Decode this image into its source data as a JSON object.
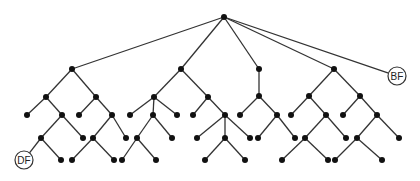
{
  "diagram": {
    "type": "tree",
    "colors": {
      "edge": "#333333",
      "node": "#111111",
      "label_circle_fill": "#ffffff"
    },
    "node_radius": 3,
    "labeled_nodes": [
      {
        "id": "BF",
        "label": "BF",
        "x": 397,
        "y": 76,
        "r": 9
      },
      {
        "id": "DF",
        "label": "DF",
        "x": 24,
        "y": 160,
        "r": 9
      }
    ],
    "nodes": [
      {
        "id": "root",
        "x": 224,
        "y": 17
      },
      {
        "id": "A",
        "x": 72,
        "y": 69
      },
      {
        "id": "B",
        "x": 181,
        "y": 69
      },
      {
        "id": "C",
        "x": 259,
        "y": 69
      },
      {
        "id": "D",
        "x": 334,
        "y": 69
      },
      {
        "id": "A1",
        "x": 46,
        "y": 97
      },
      {
        "id": "A1L",
        "x": 27,
        "y": 115
      },
      {
        "id": "A1a",
        "x": 62,
        "y": 115
      },
      {
        "id": "A1a1",
        "x": 41,
        "y": 138
      },
      {
        "id": "A1aL",
        "x": 83,
        "y": 138
      },
      {
        "id": "A1a1R",
        "x": 61,
        "y": 160
      },
      {
        "id": "A2",
        "x": 96,
        "y": 97
      },
      {
        "id": "A2L",
        "x": 79,
        "y": 115
      },
      {
        "id": "A2a",
        "x": 112,
        "y": 115
      },
      {
        "id": "A2a1",
        "x": 93,
        "y": 138
      },
      {
        "id": "A2aL",
        "x": 126,
        "y": 138
      },
      {
        "id": "A2a1L",
        "x": 72,
        "y": 160
      },
      {
        "id": "A2a1R",
        "x": 114,
        "y": 160
      },
      {
        "id": "B1",
        "x": 154,
        "y": 97
      },
      {
        "id": "B1L",
        "x": 130,
        "y": 115
      },
      {
        "id": "B1a",
        "x": 153,
        "y": 115
      },
      {
        "id": "B1R",
        "x": 177,
        "y": 115
      },
      {
        "id": "B1a1",
        "x": 137,
        "y": 138
      },
      {
        "id": "B1aR",
        "x": 172,
        "y": 138
      },
      {
        "id": "B1a1L",
        "x": 122,
        "y": 160
      },
      {
        "id": "B1a1R",
        "x": 156,
        "y": 160
      },
      {
        "id": "B2",
        "x": 208,
        "y": 97
      },
      {
        "id": "B2L",
        "x": 193,
        "y": 115
      },
      {
        "id": "B2a",
        "x": 225,
        "y": 115
      },
      {
        "id": "B2aL",
        "x": 197,
        "y": 138
      },
      {
        "id": "B2a1",
        "x": 225,
        "y": 138
      },
      {
        "id": "B2aR",
        "x": 250,
        "y": 138
      },
      {
        "id": "B2a1L",
        "x": 205,
        "y": 160
      },
      {
        "id": "B2a1R",
        "x": 245,
        "y": 160
      },
      {
        "id": "C1",
        "x": 259,
        "y": 96
      },
      {
        "id": "C1L",
        "x": 240,
        "y": 115
      },
      {
        "id": "C1a",
        "x": 277,
        "y": 115
      },
      {
        "id": "C1aL",
        "x": 258,
        "y": 138
      },
      {
        "id": "C1aR",
        "x": 295,
        "y": 138
      },
      {
        "id": "D1",
        "x": 309,
        "y": 96
      },
      {
        "id": "D1L",
        "x": 291,
        "y": 115
      },
      {
        "id": "D1a",
        "x": 326,
        "y": 115
      },
      {
        "id": "D1a1",
        "x": 305,
        "y": 138
      },
      {
        "id": "D1aR",
        "x": 346,
        "y": 138
      },
      {
        "id": "D1a1L",
        "x": 282,
        "y": 160
      },
      {
        "id": "D1a1R",
        "x": 328,
        "y": 160
      },
      {
        "id": "D2",
        "x": 360,
        "y": 96
      },
      {
        "id": "D2L",
        "x": 343,
        "y": 115
      },
      {
        "id": "D2a",
        "x": 377,
        "y": 115
      },
      {
        "id": "D2a1",
        "x": 357,
        "y": 138
      },
      {
        "id": "D2aR",
        "x": 399,
        "y": 138
      },
      {
        "id": "D2a1L",
        "x": 335,
        "y": 160
      },
      {
        "id": "D2a1R",
        "x": 382,
        "y": 160
      }
    ],
    "edges": [
      [
        "root",
        "A"
      ],
      [
        "root",
        "B"
      ],
      [
        "root",
        "C"
      ],
      [
        "root",
        "D"
      ],
      [
        "root",
        "BF"
      ],
      [
        "A",
        "A1"
      ],
      [
        "A",
        "A2"
      ],
      [
        "A1",
        "A1L"
      ],
      [
        "A1",
        "A1a"
      ],
      [
        "A1a",
        "A1a1"
      ],
      [
        "A1a",
        "A1aL"
      ],
      [
        "A1a1",
        "DF"
      ],
      [
        "A1a1",
        "A1a1R"
      ],
      [
        "A2",
        "A2L"
      ],
      [
        "A2",
        "A2a"
      ],
      [
        "A2a",
        "A2a1"
      ],
      [
        "A2a",
        "A2aL"
      ],
      [
        "A2a1",
        "A2a1L"
      ],
      [
        "A2a1",
        "A2a1R"
      ],
      [
        "B",
        "B1"
      ],
      [
        "B",
        "B2"
      ],
      [
        "B1",
        "B1L"
      ],
      [
        "B1",
        "B1a"
      ],
      [
        "B1",
        "B1R"
      ],
      [
        "B1a",
        "B1a1"
      ],
      [
        "B1a",
        "B1aR"
      ],
      [
        "B1a1",
        "B1a1L"
      ],
      [
        "B1a1",
        "B1a1R"
      ],
      [
        "B2",
        "B2L"
      ],
      [
        "B2",
        "B2a"
      ],
      [
        "B2a",
        "B2aL"
      ],
      [
        "B2a",
        "B2a1"
      ],
      [
        "B2a",
        "B2aR"
      ],
      [
        "B2a1",
        "B2a1L"
      ],
      [
        "B2a1",
        "B2a1R"
      ],
      [
        "C",
        "C1"
      ],
      [
        "C1",
        "C1L"
      ],
      [
        "C1",
        "C1a"
      ],
      [
        "C1a",
        "C1aL"
      ],
      [
        "C1a",
        "C1aR"
      ],
      [
        "D",
        "D1"
      ],
      [
        "D",
        "D2"
      ],
      [
        "D1",
        "D1L"
      ],
      [
        "D1",
        "D1a"
      ],
      [
        "D1a",
        "D1a1"
      ],
      [
        "D1a",
        "D1aR"
      ],
      [
        "D1a1",
        "D1a1L"
      ],
      [
        "D1a1",
        "D1a1R"
      ],
      [
        "D2",
        "D2L"
      ],
      [
        "D2",
        "D2a"
      ],
      [
        "D2a",
        "D2a1"
      ],
      [
        "D2a",
        "D2aR"
      ],
      [
        "D2a1",
        "D2a1L"
      ],
      [
        "D2a1",
        "D2a1R"
      ]
    ]
  }
}
